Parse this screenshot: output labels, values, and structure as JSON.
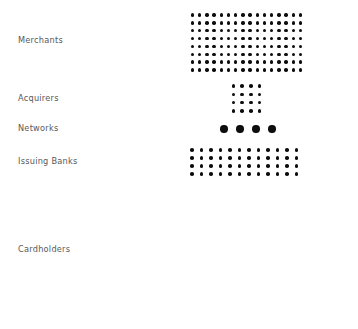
{
  "figure": {
    "background_color": "#ffffff",
    "dot_color": "#0d0d0d",
    "label_color": "#585858"
  },
  "rows": [
    {
      "id": "merchants",
      "label": "Merchants",
      "columns": 16,
      "rows": 8,
      "dot_count": 128,
      "dot_size_px": 3.4
    },
    {
      "id": "acquirers",
      "label": "Acquirers",
      "columns": 4,
      "rows": 4,
      "dot_count": 16,
      "dot_size_px": 3.6
    },
    {
      "id": "networks",
      "label": "Networks",
      "columns": 4,
      "rows": 1,
      "dot_count": 4,
      "dot_size_px": 7.4
    },
    {
      "id": "issuing-banks",
      "label": "Issuing Banks",
      "columns": 12,
      "rows": 4,
      "dot_count": 48,
      "dot_size_px": 3.5
    },
    {
      "id": "cardholders",
      "label": "Cardholders",
      "columns": 90,
      "rows": 58,
      "dot_count": 5220,
      "dot_size_px": 0.9
    }
  ],
  "chart_data": {
    "type": "bar",
    "subtitle": "",
    "xlabel": "",
    "ylabel": "",
    "categories": [
      "Merchants",
      "Acquirers",
      "Networks",
      "Issuing Banks",
      "Cardholders"
    ],
    "values": [
      128,
      16,
      4,
      48,
      5220
    ],
    "value_unit": "dots (one dot = one unit of relative scale)",
    "grid": false,
    "legend": "none"
  }
}
